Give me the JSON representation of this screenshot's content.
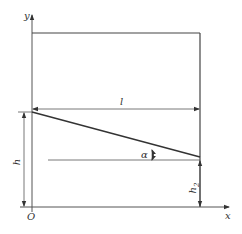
{
  "diagram": {
    "axes": {
      "x_label": "x",
      "y_label": "y",
      "origin_label": "O"
    },
    "dimensions": {
      "length_label": "l",
      "height_label": "h",
      "height2_label": "h",
      "height2_subscript": "2",
      "angle_label": "α"
    },
    "colors": {
      "line": "#444444",
      "background": "#ffffff"
    }
  }
}
